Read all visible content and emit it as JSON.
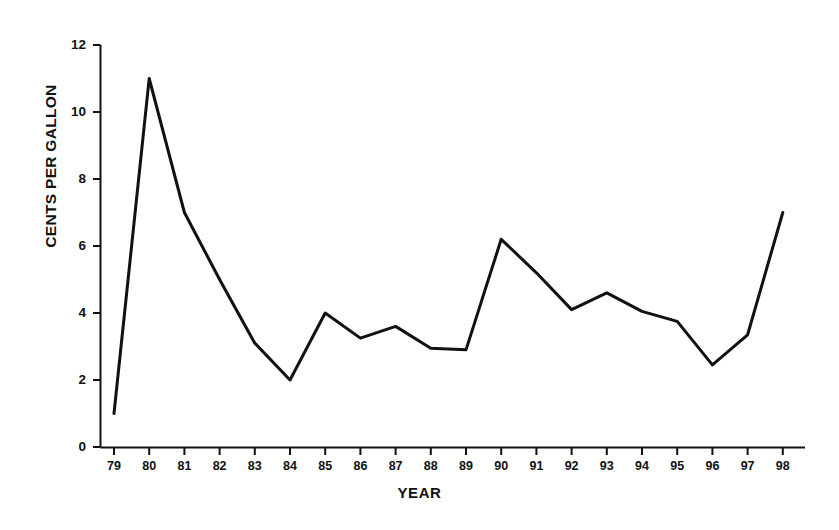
{
  "chart_data": {
    "type": "line",
    "title": "",
    "subtitle": "",
    "xlabel": "YEAR",
    "ylabel": "CENTS PER GALLON",
    "categories": [
      "79",
      "80",
      "81",
      "82",
      "83",
      "84",
      "85",
      "86",
      "87",
      "88",
      "89",
      "90",
      "91",
      "92",
      "93",
      "94",
      "95",
      "96",
      "97",
      "98"
    ],
    "x": [
      79,
      80,
      81,
      82,
      83,
      84,
      85,
      86,
      87,
      88,
      89,
      90,
      91,
      92,
      93,
      94,
      95,
      96,
      97,
      98
    ],
    "values": [
      1.0,
      11.0,
      7.0,
      5.0,
      3.1,
      2.0,
      4.0,
      3.25,
      3.6,
      2.95,
      2.9,
      6.2,
      5.2,
      4.1,
      4.6,
      4.05,
      3.75,
      2.45,
      3.35,
      7.0
    ],
    "series": [
      {
        "name": "Cents per gallon",
        "values": [
          1.0,
          11.0,
          7.0,
          5.0,
          3.1,
          2.0,
          4.0,
          3.25,
          3.6,
          2.95,
          2.9,
          6.2,
          5.2,
          4.1,
          4.6,
          4.05,
          3.75,
          2.45,
          3.35,
          7.0
        ]
      }
    ],
    "xlim": [
      79,
      98
    ],
    "ylim": [
      0,
      12
    ],
    "yticks": [
      0,
      2,
      4,
      6,
      8,
      10,
      12
    ],
    "ytick_labels": [
      "0",
      "2",
      "4",
      "6",
      "8",
      "10",
      "12"
    ],
    "xticks": [
      79,
      80,
      81,
      82,
      83,
      84,
      85,
      86,
      87,
      88,
      89,
      90,
      91,
      92,
      93,
      94,
      95,
      96,
      97,
      98
    ],
    "grid": false,
    "legend": false,
    "legend_position": "none",
    "line_color": "#111111",
    "background_color": "#ffffff",
    "annotations": []
  },
  "axes": {
    "x_title": "YEAR",
    "y_title": "CENTS PER GALLON"
  }
}
